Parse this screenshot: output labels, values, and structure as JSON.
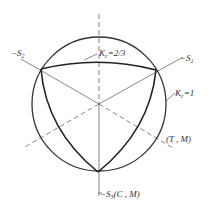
{
  "diagram": {
    "title": "",
    "labels": {
      "s1": {
        "prefix": "−S",
        "sub": "1"
      },
      "s2": {
        "prefix": "−S",
        "sub": "2"
      },
      "s3": {
        "prefix": "−S",
        "sub": "3",
        "suffix": "(C , M)"
      },
      "kc_inner": {
        "prefix": "K",
        "sub": "c",
        "suffix": "=2/3"
      },
      "kc_outer": {
        "prefix": "K",
        "sub": "c",
        "suffix": "=1"
      },
      "tm": "(T , M)"
    },
    "elements": [
      "outer circle Kc=1",
      "curved triangle Kc=2/3",
      "axis -S1",
      "axis -S2",
      "axis -S3 (C,M)",
      "dashed axis (T,M)",
      "dashed vertical axis",
      "dashed axis lower-left"
    ]
  }
}
